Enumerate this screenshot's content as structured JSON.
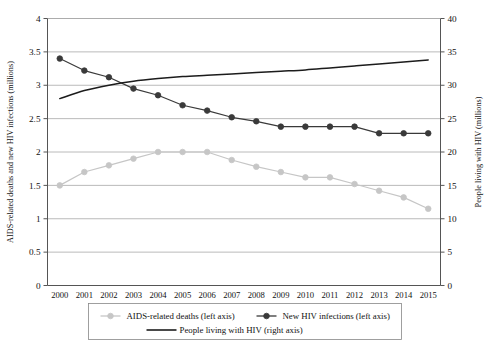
{
  "chart_data": {
    "type": "line",
    "title": "",
    "xlabel": "",
    "ylabel": "AIDS-related deaths and new HIV infections (millions)",
    "y2label": "People living with HIV (millions)",
    "categories": [
      "2000",
      "2001",
      "2002",
      "2003",
      "2004",
      "2005",
      "2006",
      "2007",
      "2008",
      "2009",
      "2010",
      "2011",
      "2012",
      "2013",
      "2014",
      "2015"
    ],
    "ylim": [
      0,
      4
    ],
    "y2lim": [
      0,
      40
    ],
    "yticks": [
      "0",
      "0.5",
      "1",
      "1.5",
      "2",
      "2.5",
      "3",
      "3.5",
      "4"
    ],
    "ytick_values": [
      0,
      0.5,
      1,
      1.5,
      2,
      2.5,
      3,
      3.5,
      4
    ],
    "y2ticks": [
      "0",
      "5",
      "10",
      "15",
      "20",
      "25",
      "30",
      "35",
      "40"
    ],
    "y2tick_values": [
      0,
      5,
      10,
      15,
      20,
      25,
      30,
      35,
      40
    ],
    "grid": true,
    "legend_position": "bottom",
    "series": [
      {
        "name": "AIDS-related deaths (left axis)",
        "axis": "left",
        "color": "#c6c6c6",
        "marker": "circle",
        "values": [
          1.5,
          1.7,
          1.8,
          1.9,
          2.0,
          2.0,
          2.0,
          1.88,
          1.78,
          1.7,
          1.62,
          1.62,
          1.52,
          1.42,
          1.32,
          1.15
        ]
      },
      {
        "name": "New HIV infections (left axis)",
        "axis": "left",
        "color": "#3a3a3a",
        "marker": "circle",
        "values": [
          3.4,
          3.22,
          3.12,
          2.95,
          2.85,
          2.7,
          2.62,
          2.52,
          2.46,
          2.38,
          2.38,
          2.38,
          2.38,
          2.28,
          2.28,
          2.28
        ]
      },
      {
        "name": "People living with HIV (right axis)",
        "axis": "right",
        "color": "#1c1c1c",
        "marker": "none",
        "values": [
          28.0,
          29.2,
          30.0,
          30.6,
          31.0,
          31.3,
          31.5,
          31.7,
          31.9,
          32.1,
          32.3,
          32.6,
          32.9,
          33.2,
          33.5,
          33.8
        ]
      }
    ]
  },
  "legend": {
    "items": [
      {
        "label": "AIDS-related deaths (left axis)",
        "color": "#c6c6c6",
        "marker": "circle"
      },
      {
        "label": "New HIV infections (left axis)",
        "color": "#3a3a3a",
        "marker": "circle"
      },
      {
        "label": "People living with HIV (right axis)",
        "color": "#1c1c1c",
        "marker": "none"
      }
    ]
  }
}
